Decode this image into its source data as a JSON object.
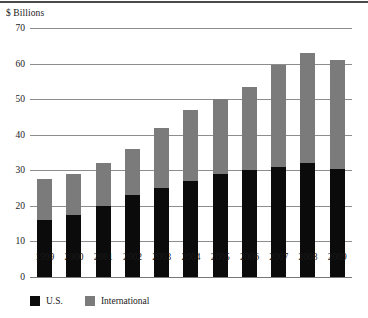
{
  "axis_title": "$ Billions",
  "legend": {
    "items": [
      {
        "label": "U.S.",
        "color": "#0b0b0b",
        "swatch_name": "legend-swatch-us"
      },
      {
        "label": "International",
        "color": "#7b7b7b",
        "swatch_name": "legend-swatch-international"
      }
    ]
  },
  "chart_data": {
    "type": "bar",
    "stacked": true,
    "title": "",
    "subtitle": "",
    "xlabel": "",
    "ylabel": "$ Billions",
    "ylim": [
      0,
      70
    ],
    "ytick_labels": [
      "70",
      "60",
      "50",
      "40",
      "30",
      "20",
      "10",
      "0"
    ],
    "ytick_values": [
      70,
      60,
      50,
      40,
      30,
      20,
      10,
      0
    ],
    "grid": true,
    "legend_position": "bottom-left",
    "categories": [
      "1999",
      "2000",
      "2001",
      "2002",
      "2003",
      "2004",
      "2005",
      "2006",
      "2007",
      "2008",
      "2009"
    ],
    "series": [
      {
        "name": "U.S.",
        "color": "#0b0b0b",
        "values": [
          16,
          17.5,
          20,
          23,
          25,
          27,
          29,
          30,
          31,
          32,
          30.5
        ]
      },
      {
        "name": "International",
        "color": "#7b7b7b",
        "values": [
          11.5,
          11.5,
          12,
          13,
          17,
          20,
          21,
          23.5,
          28.5,
          31,
          30.5
        ]
      }
    ],
    "totals": [
      27.5,
      29,
      32,
      36,
      42,
      47,
      50,
      53.5,
      59.5,
      63,
      61
    ]
  }
}
